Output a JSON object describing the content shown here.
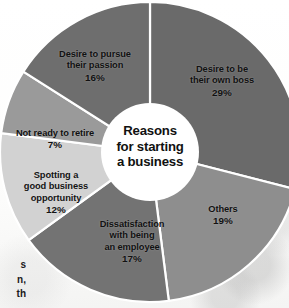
{
  "figure": {
    "center_title_lines": [
      "Reasons",
      "for starting",
      "a business"
    ],
    "background_color": "#ffffff",
    "divider_color": "#ffffff"
  },
  "edge_caption": {
    "line1": "s",
    "line2": "n,",
    "line3": "th"
  },
  "chart_data": {
    "type": "pie",
    "title": "Reasons for starting a business",
    "subtitle": "",
    "xlabel": "",
    "ylabel": "",
    "donut": true,
    "inner_radius_ratio": 0.33,
    "units": "percent",
    "legend_position": "none",
    "labels_inside_slices": true,
    "start_angle_deg": 0,
    "direction": "clockwise",
    "categories": [
      "Desire to be their own boss",
      "Others",
      "Dissatisfaction with being an employee",
      "Spotting a good business opportunity",
      "Not ready to retire",
      "Desire to pursue their passion"
    ],
    "values": [
      29,
      19,
      17,
      12,
      7,
      16
    ],
    "total": 100,
    "slices": [
      {
        "label": "Desire to be their own boss",
        "label_lines": [
          "Desire to be",
          "their own boss"
        ],
        "value": 29,
        "value_text": "29%",
        "color": "#6a6a6a"
      },
      {
        "label": "Others",
        "label_lines": [
          "Others"
        ],
        "value": 19,
        "value_text": "19%",
        "color": "#8e8e8e"
      },
      {
        "label": "Dissatisfaction with being an employee",
        "label_lines": [
          "Dissatisfaction",
          "with being",
          "an employee"
        ],
        "value": 17,
        "value_text": "17%",
        "color": "#737373"
      },
      {
        "label": "Spotting a good business opportunity",
        "label_lines": [
          "Spotting a",
          "good business",
          "opportunity"
        ],
        "value": 12,
        "value_text": "12%",
        "color": "#d2d2d2"
      },
      {
        "label": "Not ready to retire",
        "label_lines": [
          "Not ready to retire"
        ],
        "value": 7,
        "value_text": "7%",
        "color": "#9a9a9a"
      },
      {
        "label": "Desire to pursue their passion",
        "label_lines": [
          "Desire to pursue",
          "their passion"
        ],
        "value": 16,
        "value_text": "16%",
        "color": "#6e6e6e"
      }
    ]
  }
}
